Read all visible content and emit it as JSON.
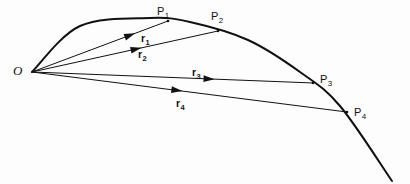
{
  "figure": {
    "kind": "vector-trajectory-diagram",
    "background_color": "#fdfdfd",
    "stroke_color": "#111111",
    "origin": {
      "label": "O",
      "x": 32,
      "y": 72
    },
    "trajectory": {
      "name": "path-curve",
      "stroke_width": 2.0,
      "start": [
        32,
        72
      ],
      "end": [
        392,
        181
      ],
      "control_points": [
        [
          32,
          72
        ],
        [
          80,
          26
        ],
        [
          150,
          18
        ],
        [
          190,
          22
        ],
        [
          248,
          40
        ],
        [
          300,
          72
        ],
        [
          340,
          106
        ],
        [
          392,
          181
        ]
      ]
    },
    "points": [
      {
        "id": "P1",
        "label": "P",
        "subscript": "1",
        "x": 168,
        "y": 21,
        "label_x": 157,
        "label_y": 6
      },
      {
        "id": "P2",
        "label": "P",
        "subscript": "2",
        "x": 218,
        "y": 31,
        "label_x": 211,
        "label_y": 11
      },
      {
        "id": "P3",
        "label": "P",
        "subscript": "3",
        "x": 313,
        "y": 83,
        "label_x": 320,
        "label_y": 74
      },
      {
        "id": "P4",
        "label": "P",
        "subscript": "4",
        "x": 347,
        "y": 112,
        "label_x": 354,
        "label_y": 107
      }
    ],
    "vectors": [
      {
        "id": "r1",
        "label": "r",
        "subscript": "1",
        "from": [
          32,
          72
        ],
        "to": [
          168,
          21
        ],
        "arrow_t": 0.72,
        "label_x": 141,
        "label_y": 33
      },
      {
        "id": "r2",
        "label": "r",
        "subscript": "2",
        "from": [
          32,
          72
        ],
        "to": [
          218,
          31
        ],
        "arrow_t": 0.56,
        "label_x": 138,
        "label_y": 49
      },
      {
        "id": "r3",
        "label": "r",
        "subscript": "3",
        "from": [
          32,
          72
        ],
        "to": [
          313,
          83
        ],
        "arrow_t": 0.63,
        "label_x": 192,
        "label_y": 67
      },
      {
        "id": "r4",
        "label": "r",
        "subscript": "4",
        "from": [
          32,
          72
        ],
        "to": [
          347,
          112
        ],
        "arrow_t": 0.46,
        "label_x": 176,
        "label_y": 98
      }
    ]
  }
}
